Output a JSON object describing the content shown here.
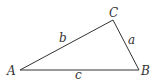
{
  "diagram": {
    "type": "triangle",
    "stroke_color": "#333333",
    "vertices": [
      {
        "name": "A",
        "x": 20,
        "y": 70,
        "label": "A",
        "label_x": 7,
        "label_y": 75
      },
      {
        "name": "B",
        "x": 139,
        "y": 70,
        "label": "B",
        "label_x": 141,
        "label_y": 75
      },
      {
        "name": "C",
        "x": 113,
        "y": 20,
        "label": "C",
        "label_x": 109,
        "label_y": 18
      }
    ],
    "sides": [
      {
        "name": "a",
        "label": "a",
        "from": "C",
        "to": "B",
        "label_x": 128,
        "label_y": 44
      },
      {
        "name": "b",
        "label": "b",
        "from": "A",
        "to": "C",
        "label_x": 59,
        "label_y": 42
      },
      {
        "name": "c",
        "label": "c",
        "from": "A",
        "to": "B",
        "label_x": 75,
        "label_y": 79
      }
    ]
  }
}
